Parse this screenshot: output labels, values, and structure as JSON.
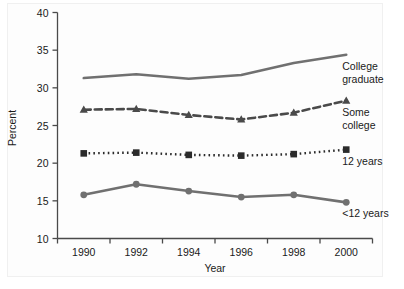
{
  "chart_data": {
    "type": "line",
    "title": "",
    "xlabel": "Year",
    "ylabel": "Percent",
    "x": [
      1990,
      1992,
      1994,
      1996,
      1998,
      2000
    ],
    "xtick_labels": [
      "1990",
      "1992",
      "1994",
      "1996",
      "1998",
      "2000"
    ],
    "xlim": [
      1989,
      2001
    ],
    "ylim": [
      10,
      40
    ],
    "ytick_labels": [
      "10",
      "15",
      "20",
      "25",
      "30",
      "35",
      "40"
    ],
    "ytick_values": [
      10,
      15,
      20,
      25,
      30,
      35,
      40
    ],
    "grid": false,
    "legend_position": "inline-right-of-line-ends",
    "series": [
      {
        "name": "College graduate",
        "label_lines": [
          "College",
          "graduate"
        ],
        "values": [
          31.3,
          31.8,
          31.2,
          31.7,
          33.3,
          34.4
        ],
        "style": "solid",
        "marker": "none",
        "color": "#707070"
      },
      {
        "name": "Some college",
        "label_lines": [
          "Some",
          "college"
        ],
        "values": [
          27.1,
          27.2,
          26.4,
          25.8,
          26.7,
          28.3
        ],
        "style": "dashed",
        "marker": "triangle",
        "color": "#4a4a4a"
      },
      {
        "name": "12 years",
        "label_lines": [
          "12 years"
        ],
        "values": [
          21.3,
          21.4,
          21.1,
          21.0,
          21.2,
          21.8
        ],
        "style": "dotted",
        "marker": "square",
        "color": "#2b2b2b"
      },
      {
        "name": "<12 years",
        "label_lines": [
          "<12 years"
        ],
        "values": [
          15.8,
          17.2,
          16.3,
          15.5,
          15.8,
          14.8
        ],
        "style": "solid",
        "marker": "circle",
        "color": "#707070"
      }
    ]
  },
  "figure": {
    "background_color": "#ffffff",
    "panel_color": "#fdfdfd",
    "axis_color": "#4a4a4a"
  }
}
